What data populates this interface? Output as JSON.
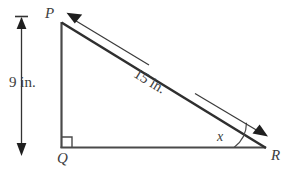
{
  "figure": {
    "type": "right-triangle-geometry-diagram",
    "background_color": "#ffffff",
    "stroke_color": "#444444",
    "labels": {
      "vertex_top": "P",
      "vertex_right_angle": "Q",
      "vertex_right": "R",
      "height_dimension": "9 in.",
      "hypotenuse_dimension": "15 in.",
      "angle": "x"
    },
    "geometry": {
      "vertex_P": [
        61,
        22
      ],
      "vertex_Q": [
        61,
        148
      ],
      "vertex_R": [
        265,
        148
      ],
      "right_angle_marker_at": "Q",
      "angle_x_at": "R",
      "leg_PQ_length_label": "9 in.",
      "hypotenuse_PR_length_label": "15 in.",
      "height_arrow": {
        "x": 21,
        "y_top": 17,
        "y_bottom": 155
      },
      "hypotenuse_arrow": {
        "from": [
          264,
          134
        ],
        "to": [
          68,
          13
        ]
      }
    }
  }
}
